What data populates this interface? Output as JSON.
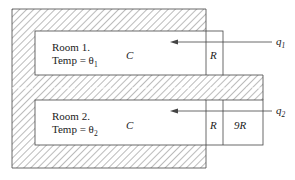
{
  "diagram": {
    "type": "thermal-two-room-model",
    "room1": {
      "name_label": "Room 1.",
      "temp_label": "Temp = θ",
      "temp_subscript": "1",
      "capacitance_label": "C",
      "wall_resistances": [
        "R"
      ]
    },
    "room2": {
      "name_label": "Room 2.",
      "temp_label": "Temp = θ",
      "temp_subscript": "2",
      "capacitance_label": "C",
      "wall_resistances": [
        "R",
        "9R"
      ]
    },
    "inputs": [
      {
        "symbol": "q",
        "subscript": "1",
        "target": "room1"
      },
      {
        "symbol": "q",
        "subscript": "2",
        "target": "room2"
      }
    ],
    "colors": {
      "line": "#444444",
      "hatch": "#555555",
      "text": "#222222",
      "background": "#ffffff"
    }
  }
}
